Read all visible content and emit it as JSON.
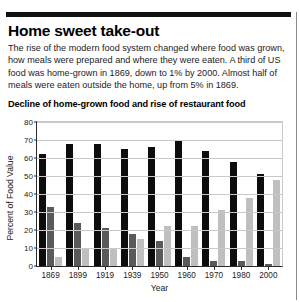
{
  "article": {
    "headline": "Home sweet take-out",
    "standfirst": "The rise of the modern food system changed where food was grown, how meals were prepared and where they were eaten. A third of US food was home-grown in 1869, down to 1% by 2000. Almost half of meals were eaten outside the home, up from 5% in 1869."
  },
  "chart_data": {
    "type": "bar",
    "title": "Decline of home-grown food and rise of restaurant food",
    "xlabel": "Year",
    "ylabel": "Percent of Food Value",
    "ylim": [
      0,
      80
    ],
    "yticks": [
      0,
      10,
      20,
      30,
      40,
      50,
      60,
      70,
      80
    ],
    "grid": true,
    "legend": "none",
    "categories": [
      "1869",
      "1899",
      "1919",
      "1939",
      "1950",
      "1960",
      "1970",
      "1980",
      "2000"
    ],
    "series": [
      {
        "name": "series-1-black",
        "color": "#0d0d0d",
        "values": [
          62,
          68,
          68,
          65,
          66,
          70,
          64,
          58,
          51
        ]
      },
      {
        "name": "series-2-dark-gray",
        "color": "#5a5a5a",
        "values": [
          33,
          24,
          21,
          18,
          14,
          5,
          3,
          3,
          1
        ]
      },
      {
        "name": "series-3-light-gray",
        "color": "#bfbfbf",
        "values": [
          5,
          10,
          10,
          15,
          22,
          22,
          31,
          38,
          48
        ]
      }
    ]
  }
}
